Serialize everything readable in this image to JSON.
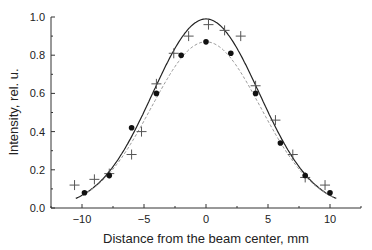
{
  "chart_data": {
    "type": "scatter",
    "title": "",
    "xlabel": "Distance from the beam center, mm",
    "ylabel": "Intensity, rel. u.",
    "xlim": [
      -12.5,
      12.5
    ],
    "ylim": [
      0.0,
      1.0
    ],
    "x_ticks": [
      "-10",
      "-5",
      "0",
      "5",
      "10"
    ],
    "x_tick_values": [
      -10,
      -5,
      0,
      5,
      10
    ],
    "y_ticks": [
      "0.0",
      "0.2",
      "0.4",
      "0.6",
      "0.8",
      "1.0"
    ],
    "y_tick_values": [
      0.0,
      0.2,
      0.4,
      0.6,
      0.8,
      1.0
    ],
    "grid": false,
    "legend": "none",
    "series": [
      {
        "name": "crosses",
        "marker": "plus",
        "x": [
          -10.6,
          -9.0,
          -7.8,
          -6.0,
          -5.2,
          -4.0,
          -2.6,
          -1.4,
          0.2,
          1.5,
          2.8,
          4.0,
          5.6,
          7.0,
          8.0,
          9.6
        ],
        "y": [
          0.12,
          0.15,
          0.18,
          0.28,
          0.4,
          0.65,
          0.81,
          0.9,
          0.96,
          0.93,
          0.9,
          0.64,
          0.46,
          0.28,
          0.16,
          0.12
        ]
      },
      {
        "name": "dots",
        "marker": "circle",
        "x": [
          -9.8,
          -7.8,
          -6.0,
          -4.0,
          -2.0,
          0.0,
          2.0,
          4.0,
          6.0,
          8.0,
          10.0
        ],
        "y": [
          0.08,
          0.17,
          0.42,
          0.6,
          0.8,
          0.87,
          0.81,
          0.6,
          0.34,
          0.17,
          0.08
        ]
      },
      {
        "name": "fit-solid",
        "line": "solid",
        "gaussian": {
          "amplitude": 0.99,
          "sigma": 4.3,
          "x_range": [
            -10.5,
            10.5
          ]
        }
      },
      {
        "name": "fit-dashed",
        "line": "dashed",
        "gaussian": {
          "amplitude": 0.87,
          "sigma": 4.4,
          "x_range": [
            -10.0,
            10.5
          ]
        }
      }
    ]
  }
}
